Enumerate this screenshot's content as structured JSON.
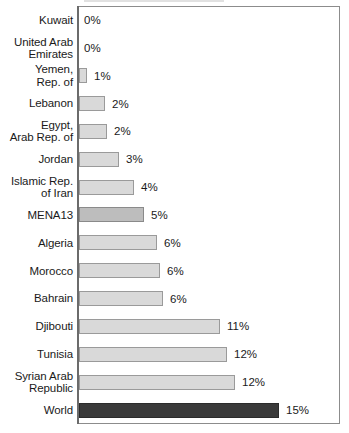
{
  "chart_data": {
    "type": "bar",
    "orientation": "horizontal",
    "title": "",
    "subtitle": "",
    "xlabel": "",
    "ylabel": "",
    "xlim": [
      0,
      19.6
    ],
    "grid": false,
    "legend": null,
    "value_suffix": "%",
    "categories": [
      "Kuwait",
      "United Arab\nEmirates",
      "Yemen,\nRep. of",
      "Lebanon",
      "Egypt,\nArab Rep. of",
      "Jordan",
      "Islamic Rep.\nof Iran",
      "MENA13",
      "Algeria",
      "Morocco",
      "Bahrain",
      "Djibouti",
      "Tunisia",
      "Syrian Arab\nRepublic",
      "World"
    ],
    "values": [
      0,
      0,
      1,
      2,
      2,
      3,
      4,
      5,
      6,
      6,
      6,
      11,
      12,
      12,
      15
    ],
    "value_labels": [
      "0%",
      "0%",
      "1%",
      "2%",
      "2%",
      "3%",
      "4%",
      "5%",
      "6%",
      "6%",
      "6%",
      "11%",
      "12%",
      "12%",
      "15%"
    ],
    "bar_pixel_widths": [
      0,
      0,
      8,
      26,
      28,
      40,
      55,
      65,
      78,
      81,
      84,
      141,
      148,
      156,
      200
    ],
    "bar_styles": [
      "normal",
      "normal",
      "normal",
      "normal",
      "normal",
      "normal",
      "normal",
      "highlight",
      "normal",
      "normal",
      "normal",
      "normal",
      "normal",
      "normal",
      "world"
    ],
    "colors": {
      "bar_fill": "#d9d9d9",
      "bar_border": "#9a9a9a",
      "highlight_fill": "#bdbdbd",
      "world_fill": "#3a3a3a",
      "axis": "#6b6b6b",
      "frame": "#8c8c8c",
      "text": "#1a1a1a",
      "background": "#ffffff"
    }
  }
}
